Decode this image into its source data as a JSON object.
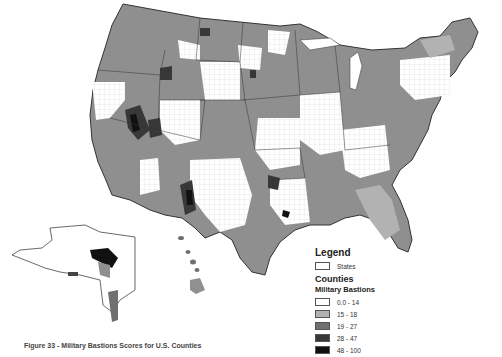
{
  "figure": {
    "caption": "Figure 33 - Military Bastions Scores for U.S. Counties"
  },
  "map": {
    "region": "United States (contiguous states, Alaska, Hawaii)",
    "unit": "Counties",
    "variable": "Military Bastions",
    "insets": [
      "Alaska",
      "Hawaii"
    ]
  },
  "legend": {
    "title": "Legend",
    "states_label": "States",
    "counties_label": "Counties",
    "variable_label": "Military Bastions",
    "classes": [
      {
        "label": "0.0 - 14",
        "color": "#ffffff"
      },
      {
        "label": "15 - 18",
        "color": "#b2b2b2"
      },
      {
        "label": "19 - 27",
        "color": "#707070"
      },
      {
        "label": "28 - 47",
        "color": "#383838"
      },
      {
        "label": "48 - 100",
        "color": "#111111"
      }
    ]
  },
  "colors": {
    "state_border": "#333333",
    "county_border": "#dddddd",
    "dominant_fill": "#8f8f8f"
  }
}
